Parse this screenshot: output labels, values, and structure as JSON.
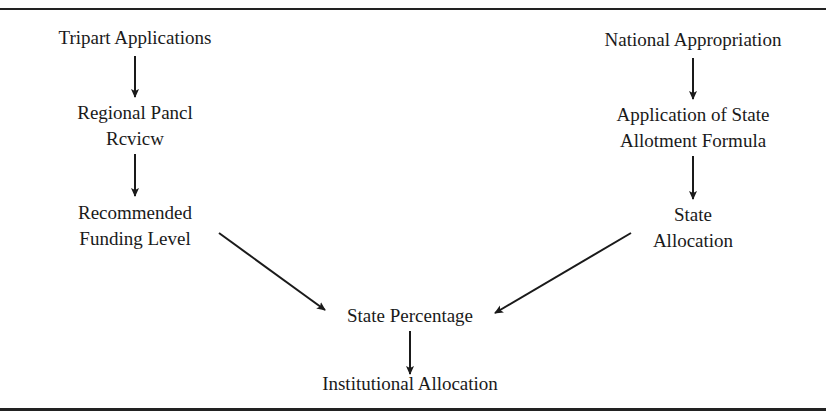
{
  "diagram": {
    "left_column": {
      "node1": {
        "label": "Tripart Applications"
      },
      "node2": {
        "line1": "Regional Pancl",
        "line2": "Rcvicw"
      },
      "node3": {
        "line1": "Recommended",
        "line2": "Funding Level"
      }
    },
    "right_column": {
      "node1": {
        "label": "National Appropriation"
      },
      "node2": {
        "line1": "Application of State",
        "line2": "Allotment Formula"
      },
      "node3": {
        "line1": "State",
        "line2": "Allocation"
      }
    },
    "merge_node": {
      "label": "State Percentage"
    },
    "final_node": {
      "label": "Institutional Allocation"
    },
    "edges": [
      {
        "from": "Tripart Applications",
        "to": "Regional Pancl Rcvicw"
      },
      {
        "from": "Regional Pancl Rcvicw",
        "to": "Recommended Funding Level"
      },
      {
        "from": "Recommended Funding Level",
        "to": "State Percentage"
      },
      {
        "from": "National Appropriation",
        "to": "Application of State Allotment Formula"
      },
      {
        "from": "Application of State Allotment Formula",
        "to": "State Allocation"
      },
      {
        "from": "State Allocation",
        "to": "State Percentage"
      },
      {
        "from": "State Percentage",
        "to": "Institutional Allocation"
      }
    ],
    "colors": {
      "line": "#1a1a1a",
      "background": "#ffffff"
    }
  }
}
